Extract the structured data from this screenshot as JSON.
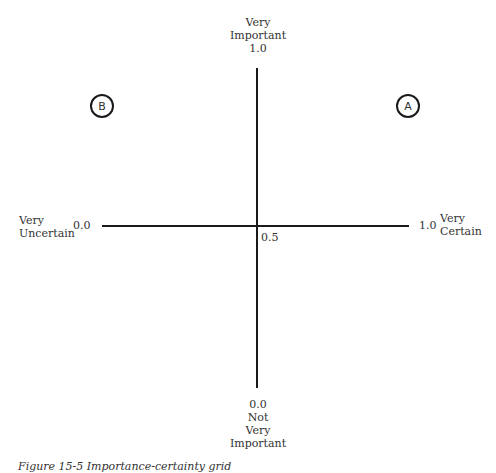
{
  "diagram": {
    "y_axis": {
      "top_label": [
        "Very",
        "Important"
      ],
      "top_value": "1.0",
      "bottom_value": "0.0",
      "bottom_label": [
        "Not",
        "Very",
        "Important"
      ]
    },
    "x_axis": {
      "left_label": [
        "Very",
        "Uncertain"
      ],
      "left_value": "0.0",
      "right_value": "1.0",
      "right_label": [
        "Very",
        "Certain"
      ],
      "center_value": "0.5"
    },
    "markers": [
      {
        "label": "A",
        "quadrant": "top-right"
      },
      {
        "label": "B",
        "quadrant": "top-left"
      }
    ],
    "caption": "Figure 15-5 Importance-certainty grid"
  }
}
